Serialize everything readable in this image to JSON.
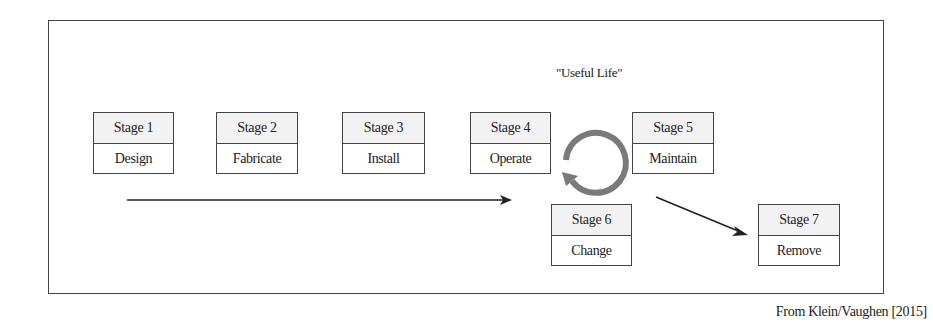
{
  "diagram": {
    "useful_life_label": "\"Useful Life\"",
    "credit": "From Klein/Vaughen [2015]",
    "stages": [
      {
        "stage": "Stage 1",
        "label": "Design"
      },
      {
        "stage": "Stage 2",
        "label": "Fabricate"
      },
      {
        "stage": "Stage 3",
        "label": "Install"
      },
      {
        "stage": "Stage 4",
        "label": "Operate"
      },
      {
        "stage": "Stage 5",
        "label": "Maintain"
      },
      {
        "stage": "Stage 6",
        "label": "Change"
      },
      {
        "stage": "Stage 7",
        "label": "Remove"
      }
    ],
    "colors": {
      "border": "#444444",
      "header_fill": "#f2f2f2",
      "cycle_arrow": "#7a7a7a",
      "arrow": "#222222"
    }
  }
}
